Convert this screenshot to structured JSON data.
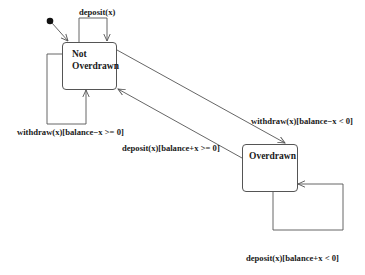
{
  "diagram": {
    "type": "UML state machine",
    "initial_state": "Not Overdrawn",
    "states": [
      {
        "id": "not_overdrawn",
        "name_line1": "Not",
        "name_line2": "Overdrawn"
      },
      {
        "id": "overdrawn",
        "name": "Overdrawn"
      }
    ],
    "transitions": [
      {
        "from": "not_overdrawn",
        "to": "not_overdrawn",
        "label": "deposit(x)"
      },
      {
        "from": "not_overdrawn",
        "to": "not_overdrawn",
        "label": "withdraw(x)[balance−x >= 0]"
      },
      {
        "from": "not_overdrawn",
        "to": "overdrawn",
        "label": "withdraw(x)[balance−x < 0]"
      },
      {
        "from": "overdrawn",
        "to": "not_overdrawn",
        "label": "deposit(x)[balance+x >= 0]"
      },
      {
        "from": "overdrawn",
        "to": "overdrawn",
        "label": "deposit(x)[balance+x < 0]"
      }
    ],
    "colors": {
      "line": "#555555",
      "text": "#1a1a1a",
      "background": "#ffffff"
    }
  }
}
